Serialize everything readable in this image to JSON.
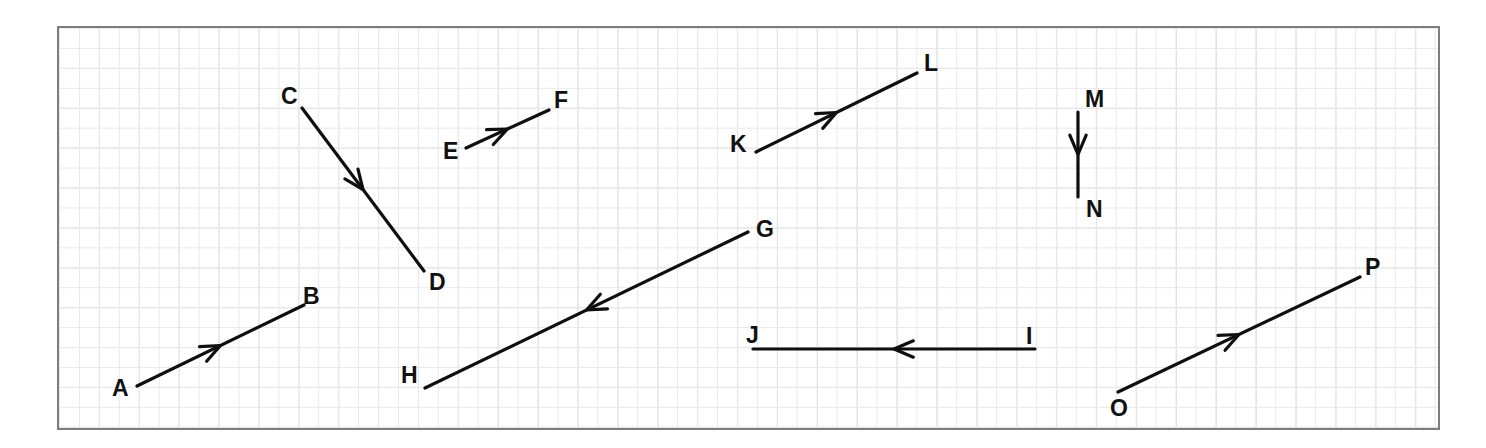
{
  "figure": {
    "background_color": "#ffffff",
    "grid_color": "#e9e9ec",
    "grid_major_color": "#d8d8dd",
    "border_color": "#7d7d7d",
    "stroke_color": "#0f0f0f",
    "canvas": {
      "x": 57,
      "y": 26,
      "width": 1383,
      "height": 404
    },
    "grid_cell_px": 19.95,
    "grid_major_cell_px": 39.9
  },
  "vectors": [
    {
      "id": "AB",
      "from_label": "A",
      "to_label": "B",
      "tail": {
        "x": 137,
        "y": 386
      },
      "tip": {
        "x": 304,
        "y": 305
      },
      "arrowhead_at": "midpoint",
      "direction": "up-right",
      "tail_label_pos": {
        "x": 112,
        "y": 377
      },
      "tip_label_pos": {
        "x": 303,
        "y": 285
      }
    },
    {
      "id": "CD",
      "from_label": "C",
      "to_label": "D",
      "tail": {
        "x": 302,
        "y": 108
      },
      "tip": {
        "x": 424,
        "y": 271
      },
      "arrowhead_at": "midpoint",
      "direction": "down-right",
      "tail_label_pos": {
        "x": 281,
        "y": 85
      },
      "tip_label_pos": {
        "x": 429,
        "y": 271
      }
    },
    {
      "id": "EF",
      "from_label": "E",
      "to_label": "F",
      "tail": {
        "x": 466,
        "y": 148
      },
      "tip": {
        "x": 549,
        "y": 110
      },
      "arrowhead_at": "midpoint",
      "direction": "up-right",
      "tail_label_pos": {
        "x": 443,
        "y": 140
      },
      "tip_label_pos": {
        "x": 554,
        "y": 89
      }
    },
    {
      "id": "GH",
      "from_label": "G",
      "to_label": "H",
      "tail": {
        "x": 748,
        "y": 232
      },
      "tip": {
        "x": 425,
        "y": 388
      },
      "arrowhead_at": "midpoint",
      "direction": "down-left",
      "tail_label_pos": {
        "x": 756,
        "y": 218
      },
      "tip_label_pos": {
        "x": 401,
        "y": 364
      }
    },
    {
      "id": "IJ",
      "from_label": "I",
      "to_label": "J",
      "tail": {
        "x": 1035,
        "y": 349
      },
      "tip": {
        "x": 753,
        "y": 349
      },
      "arrowhead_at": "midpoint",
      "direction": "left",
      "tail_label_pos": {
        "x": 1026,
        "y": 325
      },
      "tip_label_pos": {
        "x": 746,
        "y": 324
      }
    },
    {
      "id": "KL",
      "from_label": "K",
      "to_label": "L",
      "tail": {
        "x": 756,
        "y": 152
      },
      "tip": {
        "x": 917,
        "y": 73
      },
      "arrowhead_at": "midpoint",
      "direction": "up-right",
      "tail_label_pos": {
        "x": 730,
        "y": 133
      },
      "tip_label_pos": {
        "x": 924,
        "y": 52
      }
    },
    {
      "id": "MN",
      "from_label": "M",
      "to_label": "N",
      "tail": {
        "x": 1078,
        "y": 112
      },
      "tip": {
        "x": 1078,
        "y": 197
      },
      "arrowhead_at": "midpoint",
      "direction": "down",
      "tail_label_pos": {
        "x": 1085,
        "y": 88
      },
      "tip_label_pos": {
        "x": 1086,
        "y": 198
      }
    },
    {
      "id": "OP",
      "from_label": "O",
      "to_label": "P",
      "tail": {
        "x": 1118,
        "y": 392
      },
      "tip": {
        "x": 1360,
        "y": 277
      },
      "arrowhead_at": "midpoint",
      "direction": "up-right",
      "tail_label_pos": {
        "x": 1110,
        "y": 397
      },
      "tip_label_pos": {
        "x": 1365,
        "y": 256
      }
    }
  ]
}
